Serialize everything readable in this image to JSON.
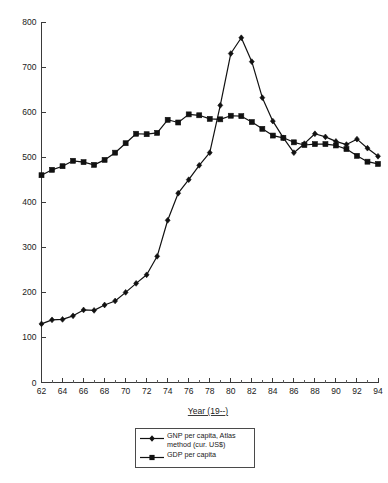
{
  "chart_data": {
    "type": "line",
    "title": "",
    "subtitle": "",
    "xlabel": "Year (19--)",
    "ylabel": "",
    "xlim": [
      62,
      94
    ],
    "ylim": [
      0,
      800
    ],
    "grid": false,
    "legend_position": "bottom-center",
    "x": [
      62,
      63,
      64,
      65,
      66,
      67,
      68,
      69,
      70,
      71,
      72,
      73,
      74,
      75,
      76,
      77,
      78,
      79,
      80,
      81,
      82,
      83,
      84,
      85,
      86,
      87,
      88,
      89,
      90,
      91,
      92,
      93,
      94
    ],
    "x_tick_labels": [
      "62",
      "64",
      "66",
      "68",
      "70",
      "72",
      "74",
      "76",
      "78",
      "80",
      "82",
      "84",
      "86",
      "88",
      "90",
      "92",
      "94"
    ],
    "x_tick_values": [
      62,
      64,
      66,
      68,
      70,
      72,
      74,
      76,
      78,
      80,
      82,
      84,
      86,
      88,
      90,
      92,
      94
    ],
    "y_tick_labels": [
      "0",
      "100",
      "200",
      "300",
      "400",
      "500",
      "600",
      "700",
      "800"
    ],
    "y_tick_values": [
      0,
      100,
      200,
      300,
      400,
      500,
      600,
      700,
      800
    ],
    "series": [
      {
        "name": "GNP per capita, Atlas\nmethod (cur. US$)",
        "legend_label": "GNP per capita, Atlas\nmethod (cur. US$)",
        "marker": "diamond",
        "color": "#111111",
        "values": [
          130,
          139,
          140,
          148,
          161,
          160,
          172,
          181,
          200,
          220,
          239,
          280,
          360,
          420,
          450,
          482,
          510,
          615,
          730,
          765,
          712,
          632,
          580,
          543,
          510,
          530,
          552,
          545,
          535,
          528,
          540,
          520,
          502
        ]
      },
      {
        "name": "GDP per capita",
        "legend_label": "GDP per capita",
        "marker": "square",
        "color": "#111111",
        "values": [
          460,
          472,
          480,
          492,
          489,
          483,
          494,
          510,
          531,
          552,
          551,
          554,
          583,
          577,
          595,
          593,
          585,
          584,
          592,
          591,
          578,
          563,
          548,
          543,
          533,
          527,
          529,
          529,
          526,
          518,
          503,
          490,
          485
        ]
      }
    ]
  },
  "legend": {
    "entries": [
      {
        "label": "GNP per capita, Atlas\nmethod (cur. US$)",
        "marker": "diamond"
      },
      {
        "label": "GDP per capita",
        "marker": "square"
      }
    ]
  },
  "axis": {
    "x_title": "Year (19--)"
  }
}
